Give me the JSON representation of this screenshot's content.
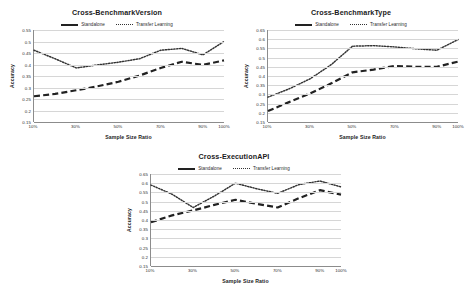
{
  "page": {
    "background": "#ffffff",
    "figure_caption": ""
  },
  "legend": {
    "position": "top-center",
    "entries": [
      {
        "label": "Standalone",
        "style": "dashed",
        "color": "#222222"
      },
      {
        "label": "Transfer Learning",
        "style": "dotted",
        "color": "#333333"
      }
    ]
  },
  "chart_data": [
    {
      "type": "line",
      "title": "Cross-BenchmarkVersion",
      "xlabel": "Sample Size Ratio",
      "ylabel": "Accuracy",
      "categories": [
        "10%",
        "20%",
        "30%",
        "40%",
        "50%",
        "60%",
        "70%",
        "80%",
        "90%",
        "100%"
      ],
      "tick_labels": [
        "10%",
        "30%",
        "50%",
        "70%",
        "90%",
        "100%"
      ],
      "ylim": [
        0.15,
        0.55
      ],
      "yticks": [
        0.15,
        0.2,
        0.25,
        0.3,
        0.35,
        0.4,
        0.45,
        0.5,
        0.55
      ],
      "grid": true,
      "series": [
        {
          "name": "Standalone",
          "values": [
            0.262,
            0.272,
            0.288,
            0.305,
            0.325,
            0.352,
            0.385,
            0.412,
            0.398,
            0.418
          ]
        },
        {
          "name": "Transfer Learning",
          "values": [
            0.462,
            0.425,
            0.385,
            0.398,
            0.41,
            0.425,
            0.462,
            0.47,
            0.442,
            0.5
          ]
        }
      ]
    },
    {
      "type": "line",
      "title": "Cross-BenchmarkType",
      "xlabel": "Sample Size Ratio",
      "ylabel": "Accuracy",
      "categories": [
        "10%",
        "20%",
        "30%",
        "40%",
        "50%",
        "60%",
        "70%",
        "80%",
        "90%",
        "100%"
      ],
      "tick_labels": [
        "10%",
        "30%",
        "50%",
        "70%",
        "90%",
        "100%"
      ],
      "ylim": [
        0.15,
        0.65
      ],
      "yticks": [
        0.15,
        0.2,
        0.25,
        0.3,
        0.35,
        0.4,
        0.45,
        0.5,
        0.55,
        0.6,
        0.65
      ],
      "grid": true,
      "series": [
        {
          "name": "Standalone",
          "values": [
            0.21,
            0.258,
            0.305,
            0.36,
            0.42,
            0.435,
            0.455,
            0.45,
            0.45,
            0.478
          ]
        },
        {
          "name": "Transfer Learning",
          "values": [
            0.285,
            0.33,
            0.385,
            0.462,
            0.562,
            0.565,
            0.558,
            0.548,
            0.54,
            0.598
          ]
        }
      ]
    },
    {
      "type": "line",
      "title": "Cross-ExecutionAPI",
      "xlabel": "Sample Size Ratio",
      "ylabel": "Accuracy",
      "categories": [
        "10%",
        "20%",
        "30%",
        "40%",
        "50%",
        "60%",
        "70%",
        "80%",
        "90%",
        "100%"
      ],
      "tick_labels": [
        "10%",
        "30%",
        "50%",
        "70%",
        "90%",
        "100%"
      ],
      "ylim": [
        0.15,
        0.65
      ],
      "yticks": [
        0.15,
        0.2,
        0.25,
        0.3,
        0.35,
        0.4,
        0.45,
        0.5,
        0.55,
        0.6,
        0.65
      ],
      "grid": true,
      "series": [
        {
          "name": "Standalone",
          "values": [
            0.388,
            0.425,
            0.452,
            0.482,
            0.51,
            0.488,
            0.468,
            0.518,
            0.562,
            0.538
          ]
        },
        {
          "name": "Transfer Learning",
          "values": [
            0.59,
            0.54,
            0.468,
            0.53,
            0.6,
            0.57,
            0.545,
            0.592,
            0.612,
            0.58
          ]
        }
      ]
    }
  ]
}
